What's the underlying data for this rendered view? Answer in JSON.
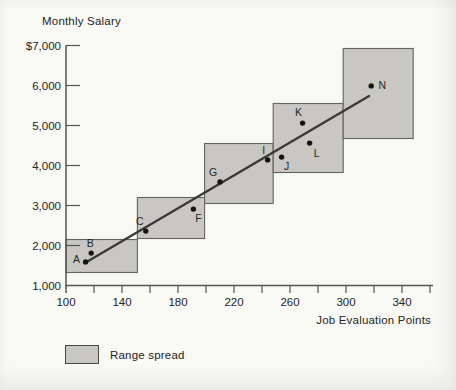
{
  "chart": {
    "title": "Monthly Salary",
    "xlabel": "Job Evaluation Points",
    "legend_label": "Range spread"
  },
  "chart_data": {
    "type": "scatter",
    "title": "Monthly Salary",
    "xlabel": "Job Evaluation Points",
    "ylabel": "Monthly Salary ($)",
    "xlim": [
      100,
      360
    ],
    "ylim": [
      1000,
      7000
    ],
    "x_tick_minor_step": 20,
    "x_ticks_labeled": [
      {
        "value": 100,
        "label": "100"
      },
      {
        "value": 140,
        "label": "140"
      },
      {
        "value": 180,
        "label": "180"
      },
      {
        "value": 220,
        "label": "220"
      },
      {
        "value": 260,
        "label": "260"
      },
      {
        "value": 300,
        "label": "300"
      },
      {
        "value": 340,
        "label": "340"
      }
    ],
    "y_ticks": [
      {
        "value": 7000,
        "label": "$7,000",
        "dash": true
      },
      {
        "value": 6000,
        "label": "6,000",
        "dash": true
      },
      {
        "value": 5000,
        "label": "5,000",
        "dash": true
      },
      {
        "value": 4000,
        "label": "4,000",
        "dash": true
      },
      {
        "value": 3000,
        "label": "3,000",
        "dash": true
      },
      {
        "value": 2000,
        "label": "2,000",
        "dash": true
      },
      {
        "value": 1000,
        "label": "1,000",
        "dash": false
      }
    ],
    "range_spreads": [
      {
        "grade": 1,
        "points_min": 100,
        "points_max": 151,
        "salary_min": 1325,
        "salary_max": 2150
      },
      {
        "grade": 2,
        "points_min": 151,
        "points_max": 199,
        "salary_min": 2175,
        "salary_max": 3200
      },
      {
        "grade": 3,
        "points_min": 199,
        "points_max": 248,
        "salary_min": 3050,
        "salary_max": 4550
      },
      {
        "grade": 4,
        "points_min": 248,
        "points_max": 298,
        "salary_min": 3825,
        "salary_max": 5550
      },
      {
        "grade": 5,
        "points_min": 298,
        "points_max": 348,
        "salary_min": 4675,
        "salary_max": 6925
      }
    ],
    "points": [
      {
        "label": "A",
        "x": 114,
        "y": 1590,
        "label_dx": -9,
        "label_dy": -3
      },
      {
        "label": "B",
        "x": 118,
        "y": 1810,
        "label_dx": -1,
        "label_dy": -10
      },
      {
        "label": "C",
        "x": 157,
        "y": 2360,
        "label_dx": -6,
        "label_dy": -10
      },
      {
        "label": "F",
        "x": 191,
        "y": 2910,
        "label_dx": 5,
        "label_dy": 9
      },
      {
        "label": "G",
        "x": 210,
        "y": 3590,
        "label_dx": -7,
        "label_dy": -10
      },
      {
        "label": "I",
        "x": 244,
        "y": 4140,
        "label_dx": -4,
        "label_dy": -10
      },
      {
        "label": "J",
        "x": 254,
        "y": 4210,
        "label_dx": 5,
        "label_dy": 9
      },
      {
        "label": "K",
        "x": 269,
        "y": 5060,
        "label_dx": -4,
        "label_dy": -11
      },
      {
        "label": "L",
        "x": 274,
        "y": 4560,
        "label_dx": 7,
        "label_dy": 10
      },
      {
        "label": "N",
        "x": 318,
        "y": 5990,
        "label_dx": 11,
        "label_dy": -1
      }
    ],
    "trend_line": {
      "x1": 113.5,
      "y1": 1560,
      "x2": 316.5,
      "y2": 5740
    },
    "legend": [
      {
        "label": "Range spread",
        "swatch": "gray-rect"
      }
    ],
    "colors": {
      "range_fill": "#c8c7c3",
      "range_border": "#64625c",
      "axis": "#55534d",
      "trend_line": "#3a3834",
      "point": "#16140f",
      "text": "#26251f",
      "paper": "#f8f8f5"
    }
  }
}
